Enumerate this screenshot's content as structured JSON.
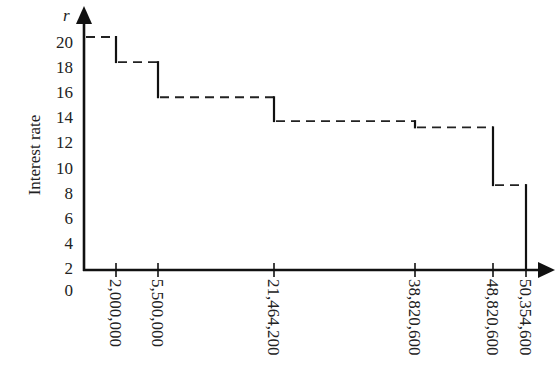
{
  "chart_data": {
    "type": "line",
    "subtype": "step",
    "title": "",
    "xlabel": "",
    "ylabel": "Interest rate",
    "y_axis_variable": "r",
    "y_ticks": [
      "0",
      "2",
      "4",
      "6",
      "8",
      "10",
      "12",
      "14",
      "16",
      "18",
      "20"
    ],
    "x_ticks": [
      "2,000,000",
      "5,500,000",
      "21,464,200",
      "38,820,600",
      "48,820,600",
      "50,354,600"
    ],
    "x_tick_values": [
      2000000,
      5500000,
      21464200,
      38820600,
      48820600,
      50354600
    ],
    "ylim": [
      0,
      21
    ],
    "grid": false,
    "legend": null,
    "series": [
      {
        "name": "Interest rate",
        "segments": [
          {
            "x_start": 0,
            "x_end": 2000000,
            "r": 20.4
          },
          {
            "x_start": 2000000,
            "x_end": 5500000,
            "r": 18.4
          },
          {
            "x_start": 5500000,
            "x_end": 21464200,
            "r": 15.6
          },
          {
            "x_start": 21464200,
            "x_end": 38820600,
            "r": 13.7
          },
          {
            "x_start": 38820600,
            "x_end": 48820600,
            "r": 13.2
          },
          {
            "x_start": 48820600,
            "x_end": 50354600,
            "r": 8.6
          }
        ],
        "horizontal_style": "dashed",
        "vertical_style": "solid"
      }
    ]
  }
}
